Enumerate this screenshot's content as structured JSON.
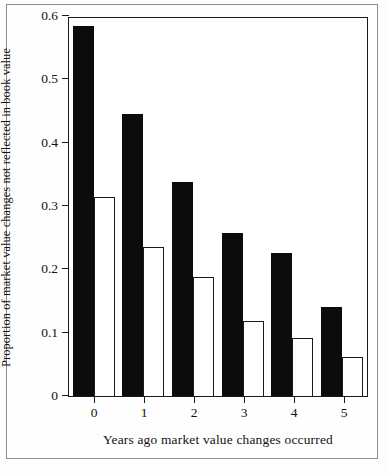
{
  "chart_data": {
    "type": "bar",
    "title": "",
    "xlabel": "Years ago market value changes occurred",
    "ylabel": "Proportion of market value changes not reflected in book value",
    "categories": [
      "0",
      "1",
      "2",
      "3",
      "4",
      "5"
    ],
    "series": [
      {
        "name": "solid-black-series",
        "values": [
          0.585,
          0.445,
          0.338,
          0.257,
          0.226,
          0.14
        ]
      },
      {
        "name": "hollow-white-series",
        "values": [
          0.315,
          0.236,
          0.188,
          0.118,
          0.092,
          0.061
        ]
      }
    ],
    "ylim": [
      0,
      0.6
    ],
    "yticks": [
      0,
      0.1,
      0.2,
      0.3,
      0.4,
      0.5,
      0.6
    ],
    "ytick_labels": [
      "0",
      "0.1",
      "0.2",
      "0.3",
      "0.4",
      "0.5",
      "0.6"
    ],
    "grid": false,
    "legend": "none",
    "colors": {
      "solid_bar": "#0c0c0c",
      "hollow_bar_fill": "#ffffff",
      "hollow_bar_stroke": "#1a1a1a",
      "axis": "#1a1a1a",
      "background": "#ffffff"
    }
  }
}
